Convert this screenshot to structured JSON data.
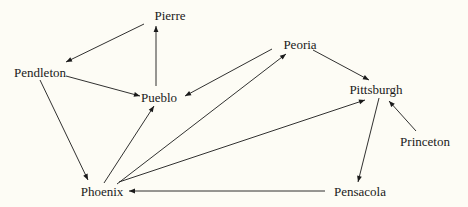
{
  "diagram": {
    "type": "directed-graph",
    "background": "#fdfcf5",
    "edge_color": "#1a1a1a",
    "nodes": [
      {
        "id": "pierre",
        "label": "Pierre",
        "x": 170,
        "y": 15
      },
      {
        "id": "pendleton",
        "label": "Pendleton",
        "x": 40,
        "y": 72
      },
      {
        "id": "pueblo",
        "label": "Pueblo",
        "x": 159,
        "y": 97
      },
      {
        "id": "peoria",
        "label": "Peoria",
        "x": 300,
        "y": 44
      },
      {
        "id": "pittsburgh",
        "label": "Pittsburgh",
        "x": 376,
        "y": 89
      },
      {
        "id": "princeton",
        "label": "Princeton",
        "x": 425,
        "y": 141
      },
      {
        "id": "phoenix",
        "label": "Phoenix",
        "x": 102,
        "y": 191
      },
      {
        "id": "pensacola",
        "label": "Pensacola",
        "x": 360,
        "y": 191
      }
    ],
    "edges": [
      {
        "from": "pierre",
        "to": "pendleton"
      },
      {
        "from": "pueblo",
        "to": "pierre"
      },
      {
        "from": "pendleton",
        "to": "pueblo"
      },
      {
        "from": "pendleton",
        "to": "phoenix"
      },
      {
        "from": "peoria",
        "to": "pueblo"
      },
      {
        "from": "peoria",
        "to": "pittsburgh"
      },
      {
        "from": "phoenix",
        "to": "pueblo"
      },
      {
        "from": "phoenix",
        "to": "peoria"
      },
      {
        "from": "phoenix",
        "to": "pittsburgh"
      },
      {
        "from": "pittsburgh",
        "to": "pensacola"
      },
      {
        "from": "princeton",
        "to": "pittsburgh"
      },
      {
        "from": "pensacola",
        "to": "phoenix"
      }
    ]
  }
}
